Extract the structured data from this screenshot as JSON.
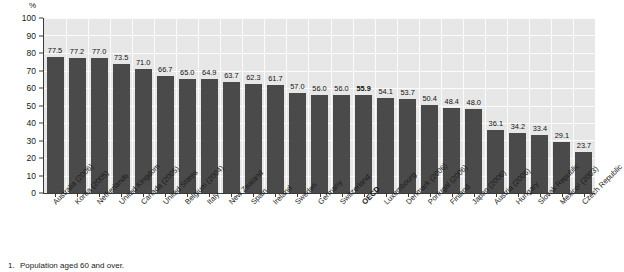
{
  "chart_data": {
    "type": "bar",
    "title": "",
    "subtitle": "",
    "xlabel": "",
    "ylabel": "",
    "y_unit": "%",
    "ylim": [
      0,
      100
    ],
    "ytick_step": 10,
    "yticks": [
      "100",
      "90",
      "80",
      "70",
      "60",
      "50",
      "40",
      "30",
      "20",
      "10",
      "0"
    ],
    "grid": true,
    "legend": "none",
    "highlight_category": "OECD",
    "categories": [
      "Australia (2006)",
      "Korea (2005)",
      "Netherlands",
      "United Kingdom",
      "Canada (2005)",
      "United States",
      "Belgium (2004)",
      "Italy",
      "New Zealand",
      "Spain",
      "Ireland",
      "Sweden",
      "Germany",
      "Switzerland",
      "OECD",
      "Luxembourg",
      "Denmark (2006)",
      "Portugal (2006)",
      "Finland",
      "Japan (2006)",
      "Austria (2006)",
      "Hungary",
      "Slovak Republic",
      "Mexico¹ (2003)",
      "Czech Republic"
    ],
    "values": [
      77.5,
      77.2,
      77.0,
      73.5,
      71.0,
      66.7,
      65.0,
      64.9,
      63.7,
      62.3,
      61.7,
      57.0,
      56.0,
      56.0,
      55.9,
      54.1,
      53.7,
      50.4,
      48.4,
      48.0,
      36.1,
      34.2,
      33.4,
      29.1,
      23.7
    ],
    "value_labels": [
      "77.5",
      "77.2",
      "77.0",
      "73.5",
      "71.0",
      "66.7",
      "65.0",
      "64.9",
      "63.7",
      "62.3",
      "61.7",
      "57.0",
      "56.0",
      "56.0",
      "55.9",
      "54.1",
      "53.7",
      "50.4",
      "48.4",
      "48.0",
      "36.1",
      "34.2",
      "33.4",
      "29.1",
      "23.7"
    ],
    "colors": {
      "bar": "#4a4a4a",
      "plot_background": "#e7e7e7",
      "gridline": "#fbfbfb",
      "axis": "#3a3a3a",
      "text": "#1a1a1a"
    }
  },
  "footnote": {
    "number": "1.",
    "text": "Population aged 60 and over."
  }
}
